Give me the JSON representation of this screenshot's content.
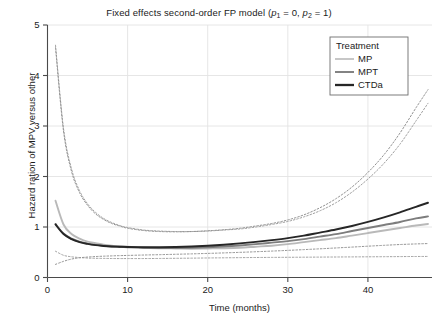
{
  "chart_data": {
    "type": "line",
    "title": "Fixed effects second-order FP model (p1 = 0, p2 = 1)",
    "title_parts": {
      "prefix": "Fixed effects second-order FP model (",
      "p1_symbol": "p",
      "p1_sub": "1",
      "p1_eq": " = 0, ",
      "p2_symbol": "p",
      "p2_sub": "2",
      "p2_eq": " = 1)"
    },
    "xlabel": "Time (months)",
    "ylabel": "Hazard ration of MPV versus other",
    "xlim": [
      0,
      48
    ],
    "ylim": [
      0,
      5
    ],
    "xticks": [
      0,
      10,
      20,
      30,
      40
    ],
    "xticklabels": [
      "0",
      "10",
      "20",
      "30",
      "40"
    ],
    "yticks": [
      0,
      1,
      2,
      3,
      4,
      5
    ],
    "yticklabels": [
      "0",
      "1",
      "2",
      "3",
      "4",
      "5"
    ],
    "grid": true,
    "grid_color": "#e3e3e3",
    "legend": {
      "title": "Treatment",
      "position": "top-right",
      "entries": [
        {
          "label": "MP",
          "color": "#b9b9b9"
        },
        {
          "label": "MPT",
          "color": "#7d7d7d"
        },
        {
          "label": "CTDa",
          "color": "#262626"
        }
      ]
    },
    "x": [
      1,
      2,
      3,
      4,
      5,
      6,
      7,
      8,
      9,
      10,
      12,
      14,
      16,
      18,
      20,
      22,
      24,
      26,
      28,
      30,
      32,
      34,
      36,
      38,
      40,
      42,
      44,
      46,
      47.5
    ],
    "series": [
      {
        "name": "MP",
        "color": "#b9b9b9",
        "style": "solid",
        "values": [
          1.52,
          1.05,
          0.86,
          0.77,
          0.71,
          0.68,
          0.65,
          0.63,
          0.62,
          0.61,
          0.59,
          0.58,
          0.575,
          0.57,
          0.575,
          0.58,
          0.59,
          0.61,
          0.63,
          0.66,
          0.7,
          0.74,
          0.78,
          0.83,
          0.88,
          0.93,
          0.98,
          1.03,
          1.06
        ]
      },
      {
        "name": "MPT",
        "color": "#7d7d7d",
        "style": "solid",
        "values": [
          1.06,
          0.87,
          0.77,
          0.71,
          0.67,
          0.645,
          0.63,
          0.615,
          0.605,
          0.6,
          0.59,
          0.585,
          0.585,
          0.59,
          0.6,
          0.615,
          0.635,
          0.66,
          0.69,
          0.72,
          0.76,
          0.81,
          0.86,
          0.92,
          0.98,
          1.04,
          1.1,
          1.17,
          1.21
        ]
      },
      {
        "name": "CTDa",
        "color": "#262626",
        "style": "solid",
        "values": [
          1.05,
          0.86,
          0.76,
          0.7,
          0.665,
          0.64,
          0.625,
          0.615,
          0.61,
          0.605,
          0.6,
          0.6,
          0.605,
          0.615,
          0.63,
          0.65,
          0.675,
          0.705,
          0.74,
          0.78,
          0.83,
          0.89,
          0.95,
          1.02,
          1.1,
          1.19,
          1.29,
          1.4,
          1.48
        ]
      },
      {
        "name": "MP upper CI",
        "color": "#9a9a9a",
        "style": "dotted",
        "values": [
          4.6,
          2.95,
          2.15,
          1.72,
          1.46,
          1.29,
          1.17,
          1.09,
          1.03,
          0.99,
          0.94,
          0.92,
          0.91,
          0.91,
          0.92,
          0.94,
          0.96,
          1.0,
          1.05,
          1.11,
          1.2,
          1.32,
          1.48,
          1.69,
          1.95,
          2.26,
          2.64,
          3.1,
          3.45
        ]
      },
      {
        "name": "MPT upper CI",
        "color": "#8c8c8c",
        "style": "dotted",
        "values": [
          4.55,
          2.9,
          2.1,
          1.68,
          1.43,
          1.26,
          1.15,
          1.07,
          1.02,
          0.975,
          0.93,
          0.91,
          0.905,
          0.91,
          0.925,
          0.945,
          0.975,
          1.02,
          1.07,
          1.14,
          1.24,
          1.38,
          1.56,
          1.79,
          2.08,
          2.43,
          2.86,
          3.36,
          3.72
        ]
      },
      {
        "name": "MP lower CI",
        "color": "#9a9a9a",
        "style": "dotted",
        "values": [
          0.52,
          0.44,
          0.41,
          0.395,
          0.385,
          0.38,
          0.378,
          0.376,
          0.375,
          0.375,
          0.375,
          0.377,
          0.38,
          0.383,
          0.387,
          0.39,
          0.393,
          0.396,
          0.398,
          0.4,
          0.402,
          0.404,
          0.406,
          0.408,
          0.41,
          0.412,
          0.414,
          0.416,
          0.417
        ]
      },
      {
        "name": "MPT lower CI",
        "color": "#8c8c8c",
        "style": "dotted",
        "values": [
          0.26,
          0.32,
          0.365,
          0.39,
          0.405,
          0.415,
          0.422,
          0.428,
          0.433,
          0.437,
          0.445,
          0.452,
          0.46,
          0.468,
          0.477,
          0.487,
          0.498,
          0.51,
          0.523,
          0.537,
          0.552,
          0.568,
          0.585,
          0.602,
          0.62,
          0.637,
          0.653,
          0.665,
          0.672
        ]
      }
    ]
  }
}
